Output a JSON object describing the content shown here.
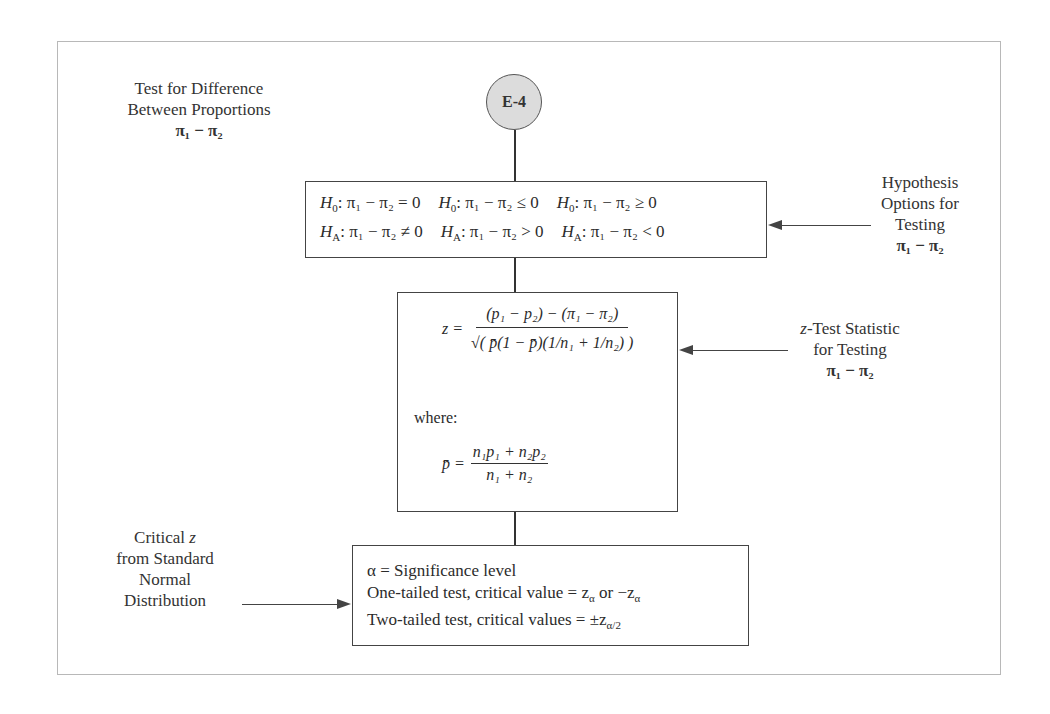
{
  "node": {
    "label": "E-4"
  },
  "title_label": {
    "line1": "Test for  Difference",
    "line2": "Between Proportions",
    "param": "π₁ − π₂"
  },
  "hypotheses": {
    "columns": [
      {
        "h0_prefix": "H",
        "h0_sub": "0",
        "h0_expr": ": π₁ − π₂ = 0",
        "ha_prefix": "H",
        "ha_sub": "A",
        "ha_expr": ": π₁ − π₂ ≠ 0"
      },
      {
        "h0_prefix": "H",
        "h0_sub": "0",
        "h0_expr": ": π₁ − π₂  ≤ 0",
        "ha_prefix": "H",
        "ha_sub": "A",
        "ha_expr": ": π₁ − π₂ > 0"
      },
      {
        "h0_prefix": "H",
        "h0_sub": "0",
        "h0_expr": ": π₁ − π₂ ≥ 0",
        "ha_prefix": "H",
        "ha_sub": "A",
        "ha_expr": ": π₁ − π₂ < 0"
      }
    ]
  },
  "hypothesis_label": {
    "line1": "Hypothesis",
    "line2": "Options for",
    "line3": "Testing",
    "param": "π₁ − π₂"
  },
  "formula": {
    "z_lhs": "z =",
    "numerator": "(p₁ − p₂) − (π₁ − π₂)",
    "denominator": "√( p̄(1 − p̄)(1/n₁ + 1/n₂) )",
    "where": "where:",
    "pbar_lhs": "p̄ =",
    "pbar_num": "n₁p₁ + n₂p₂",
    "pbar_den": "n₁ + n₂"
  },
  "statistic_label": {
    "line1_italic": "z",
    "line1_rest": "-Test Statistic",
    "line2": "for Testing",
    "param": "π₁ − π₂"
  },
  "critical_label": {
    "line1": "Critical ",
    "line1_italic": "z",
    "line2": "from Standard",
    "line3": "Normal",
    "line4": "Distribution"
  },
  "critical_box": {
    "line1": "α = Significance level",
    "line2": "One-tailed test, critical value = z",
    "line2_sub": "α",
    "line2_mid": " or −z",
    "line2_sub2": "α",
    "line3": "Two-tailed test, critical values = ±z",
    "line3_sub": "α/2"
  }
}
